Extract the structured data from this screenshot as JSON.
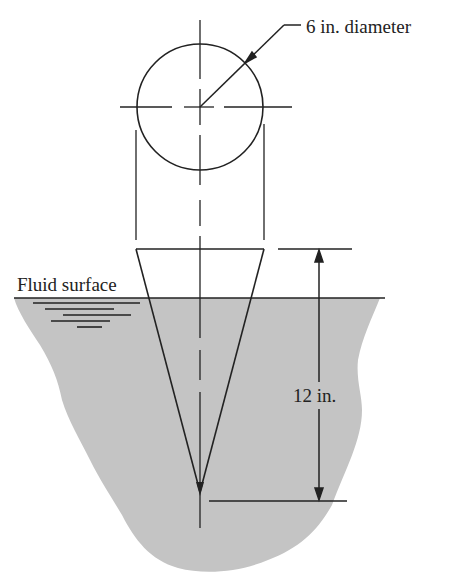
{
  "figure": {
    "labels": {
      "diameter": "6 in. diameter",
      "fluid_surface": "Fluid surface",
      "height": "12 in."
    },
    "dimensions": {
      "cone_top_diameter_in": 6,
      "cone_height_in": 12
    },
    "colors": {
      "fluid_fill": "#c4c4c4",
      "line": "#222222",
      "background": "#ffffff"
    }
  }
}
